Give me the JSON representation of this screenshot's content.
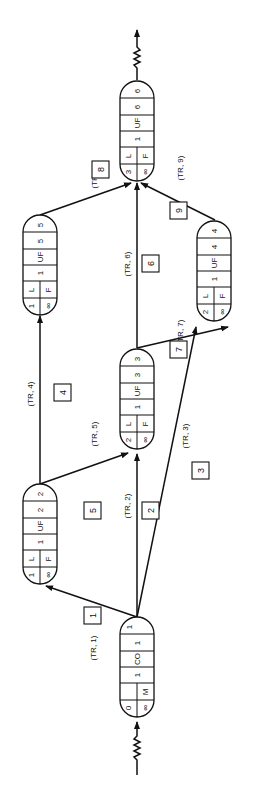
{
  "diagram": {
    "orientation": "rotated-90-ccw",
    "nodes": [
      {
        "id": "n1",
        "cells": {
          "id_top": "0",
          "id_bottom": "∞",
          "type_top": "",
          "type_bottom": "M",
          "c1": "1",
          "c2": "CO",
          "c3": "1",
          "c4": "1"
        }
      },
      {
        "id": "n2",
        "cells": {
          "id_top": "1",
          "id_bottom": "∞",
          "type_top": "L",
          "type_bottom": "F",
          "c1": "1",
          "c2": "UF",
          "c3": "2",
          "c4": "2"
        }
      },
      {
        "id": "n3",
        "cells": {
          "id_top": "2",
          "id_bottom": "∞",
          "type_top": "L",
          "type_bottom": "F",
          "c1": "1",
          "c2": "UF",
          "c3": "3",
          "c4": "3"
        }
      },
      {
        "id": "n4",
        "cells": {
          "id_top": "2",
          "id_bottom": "∞",
          "type_top": "L",
          "type_bottom": "F",
          "c1": "1",
          "c2": "UF",
          "c3": "4",
          "c4": "4"
        }
      },
      {
        "id": "n5",
        "cells": {
          "id_top": "1",
          "id_bottom": "∞",
          "type_top": "L",
          "type_bottom": "F",
          "c1": "1",
          "c2": "UF",
          "c3": "5",
          "c4": "5"
        }
      },
      {
        "id": "n6",
        "cells": {
          "id_top": "3",
          "id_bottom": "∞",
          "type_top": "L",
          "type_bottom": "F",
          "c1": "1",
          "c2": "UF",
          "c3": "6",
          "c4": "6"
        }
      }
    ],
    "edges": [
      {
        "num": "1",
        "label": "(TR, 1)"
      },
      {
        "num": "2",
        "label": "(TR, 2)"
      },
      {
        "num": "3",
        "label": "(TR, 3)"
      },
      {
        "num": "4",
        "label": "(TR, 4)"
      },
      {
        "num": "5",
        "label": "(TR, 5)"
      },
      {
        "num": "6",
        "label": "(TR, 6)"
      },
      {
        "num": "7",
        "label": "(TR, 7)"
      },
      {
        "num": "8",
        "label": "(TR, 8)"
      },
      {
        "num": "9",
        "label": "(TR, 9)"
      }
    ]
  }
}
